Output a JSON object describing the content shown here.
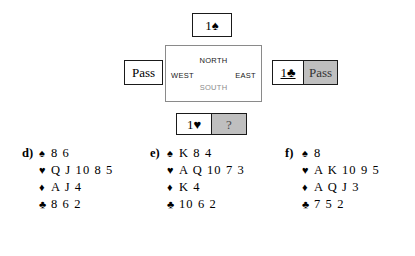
{
  "bidding": {
    "north_bid": {
      "label": "1♠",
      "name": "north-bid"
    },
    "west_bid": {
      "label": "Pass",
      "name": "west-bid"
    },
    "east_bid": {
      "label": "1♣",
      "name": "east-bid"
    },
    "east_pass": {
      "label": "Pass",
      "name": "east-pass"
    },
    "south_bid": {
      "label": "1♥",
      "name": "south-bid"
    },
    "south_prompt": {
      "label": "?",
      "name": "south-prompt"
    },
    "compass": {
      "north": "NORTH",
      "south": "SOUTH",
      "west": "WEST",
      "east": "EAST"
    },
    "colors": {
      "shaded_background": "#bfbfbf",
      "box_border": "#1a1a1a",
      "compass_border": "#8a8a8a",
      "south_label": "#8c8c8c"
    }
  },
  "hands": [
    {
      "label": "d)",
      "spades": "8 6",
      "hearts": "Q J 10 8 5",
      "diamonds": "A J 4",
      "clubs": "8 6 2"
    },
    {
      "label": "e)",
      "spades": "K 8 4",
      "hearts": "A Q 10 7 3",
      "diamonds": "K 4",
      "clubs": "10 6 2"
    },
    {
      "label": "f)",
      "spades": "8",
      "hearts": "A K 10 9 5",
      "diamonds": "A Q J 3",
      "clubs": "7 5 2"
    }
  ],
  "suit_symbols": {
    "spade": "♠",
    "heart": "♥",
    "diamond": "♦",
    "club": "♣"
  }
}
